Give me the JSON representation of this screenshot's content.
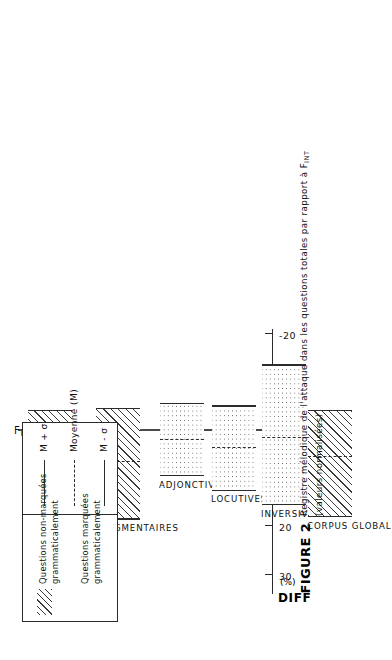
{
  "figure": {
    "number": "FIGURE 2",
    "caption_line1": "Registre mélodique de l'attaque dans les questions totales par rapport à F",
    "caption_line1_sub": "INT",
    "caption_line2": "(valeurs normalisées)"
  },
  "axis": {
    "title": "DIFF",
    "unit": "(%)",
    "baseline_label": "F",
    "baseline_label_sub": "INT"
  },
  "legend": {
    "patterns": [
      {
        "id": "hatch",
        "swatch": "hatch",
        "line1": "Questions non-marquées",
        "line2": "grammaticalement"
      },
      {
        "id": "stipple",
        "swatch": "stipple",
        "line1": "Questions marquées",
        "line2": "grammaticalement"
      }
    ],
    "lines": [
      {
        "style": "solid",
        "label": "M + σ"
      },
      {
        "style": "dashed",
        "label": "Moyenne (M)"
      },
      {
        "style": "solid",
        "label": "M - σ"
      }
    ]
  },
  "chart_data": {
    "type": "bar",
    "xlabel": "",
    "ylabel": "DIFF (%)",
    "ylim": [
      -20,
      35
    ],
    "yticks": [
      30,
      20,
      10,
      0,
      -10,
      -20
    ],
    "ytick_labels": [
      "30",
      "20",
      "10",
      "0",
      "-10",
      "-20"
    ],
    "grid": false,
    "orientation": "vertical-rotated",
    "legend_position": "top-left",
    "categories": [
      "MELODIQUES",
      "FRAGMENTAIRES",
      "ADJONCTIVES",
      "LOCUTIVES",
      "INVERSIVES",
      "CORPUS GLOBAL"
    ],
    "series": [
      {
        "name": "M + σ",
        "values": [
          13.0,
          18.5,
          9.5,
          12.5,
          15.5,
          18.0
        ]
      },
      {
        "name": "Moyenne (M)",
        "values": [
          4.0,
          6.5,
          2.0,
          3.5,
          1.5,
          5.5
        ]
      },
      {
        "name": "M - σ",
        "values": [
          -4.0,
          -4.5,
          -5.5,
          -5.0,
          -13.5,
          -4.0
        ]
      }
    ],
    "bars": [
      {
        "label": "MELODIQUES",
        "pattern": "hatch",
        "top": 13.0,
        "mean": 4.0,
        "bottom": -4.0
      },
      {
        "label": "FRAGMENTAIRES",
        "pattern": "hatch",
        "top": 18.5,
        "mean": 6.5,
        "bottom": -4.5
      },
      {
        "label": "ADJONCTIVES",
        "pattern": "stipple",
        "top": 9.5,
        "mean": 2.0,
        "bottom": -5.5
      },
      {
        "label": "LOCUTIVES",
        "pattern": "stipple",
        "top": 12.5,
        "mean": 3.5,
        "bottom": -5.0
      },
      {
        "label": "INVERSIVES",
        "pattern": "stipple",
        "top": 15.5,
        "mean": 1.5,
        "bottom": -13.5
      },
      {
        "label": "CORPUS GLOBAL",
        "pattern": "hatch",
        "top": 18.0,
        "mean": 5.5,
        "bottom": -4.0
      }
    ]
  }
}
